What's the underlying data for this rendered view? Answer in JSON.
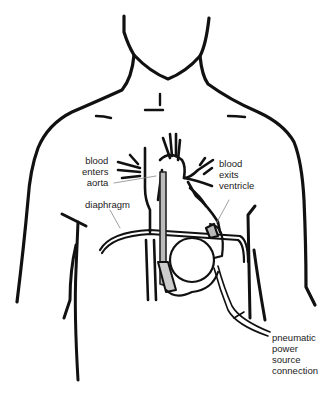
{
  "diagram": {
    "labels": {
      "blood_enters_aorta": [
        "blood",
        "enters",
        "aorta"
      ],
      "blood_exits_ventricle": [
        "blood",
        "exits",
        "ventricle"
      ],
      "diaphragm": "diaphragm",
      "pneumatic_power": [
        "pneumatic",
        "power",
        "source",
        "connection"
      ]
    },
    "colors": {
      "line": "#111111",
      "label_text": "#222222",
      "leader_line": "#888888",
      "graft_fill": "#bbbbbb",
      "background": "#ffffff"
    }
  }
}
